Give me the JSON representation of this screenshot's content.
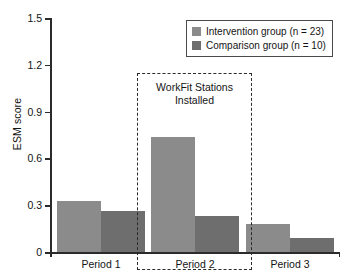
{
  "chart_data": {
    "type": "bar",
    "title": "",
    "xlabel": "",
    "ylabel": "ESM score",
    "categories": [
      "Period 1",
      "Period 2",
      "Period 3"
    ],
    "series": [
      {
        "name": "Intervention group (n = 23)",
        "color": "#8b8b8b",
        "values": [
          0.33,
          0.74,
          0.18
        ]
      },
      {
        "name": "Comparison group (n = 10)",
        "color": "#6e6e6e",
        "values": [
          0.26,
          0.23,
          0.09
        ]
      }
    ],
    "ylim": [
      0,
      1.5
    ],
    "yticks": [
      "0",
      "0.3",
      "0.6",
      "0.9",
      "1.2",
      "1.5"
    ],
    "ytick_values": [
      0,
      0.3,
      0.6,
      0.9,
      1.2,
      1.5
    ],
    "grid": false,
    "legend_position": "top-right",
    "annotations": [
      {
        "text": "WorkFit Stations Installed",
        "line1": "WorkFit Stations",
        "line2": "Installed",
        "target_category": "Period 2",
        "style": "dashed-box"
      }
    ]
  },
  "axis": {
    "y_title": "ESM score",
    "ticks": [
      {
        "label": "1.5",
        "value": 1.5
      },
      {
        "label": "1.2",
        "value": 1.2
      },
      {
        "label": "0.9",
        "value": 0.9
      },
      {
        "label": "0.6",
        "value": 0.6
      },
      {
        "label": "0.3",
        "value": 0.3
      },
      {
        "label": "0",
        "value": 0
      }
    ]
  },
  "groups": [
    {
      "label": "Period 1",
      "a": 0.33,
      "b": 0.26
    },
    {
      "label": "Period 2",
      "a": 0.74,
      "b": 0.23
    },
    {
      "label": "Period 3",
      "a": 0.18,
      "b": 0.09
    }
  ],
  "legend": {
    "items": [
      {
        "label": "Intervention group (n = 23)",
        "color": "#8b8b8b"
      },
      {
        "label": "Comparison group (n = 10)",
        "color": "#6e6e6e"
      }
    ]
  },
  "annotation": {
    "line1": "WorkFit Stations",
    "line2": "Installed"
  },
  "colors": {
    "series_a": "#8b8b8b",
    "series_b": "#6e6e6e",
    "axis": "#2b2b2b",
    "text": "#141414",
    "background": "#ffffff"
  }
}
